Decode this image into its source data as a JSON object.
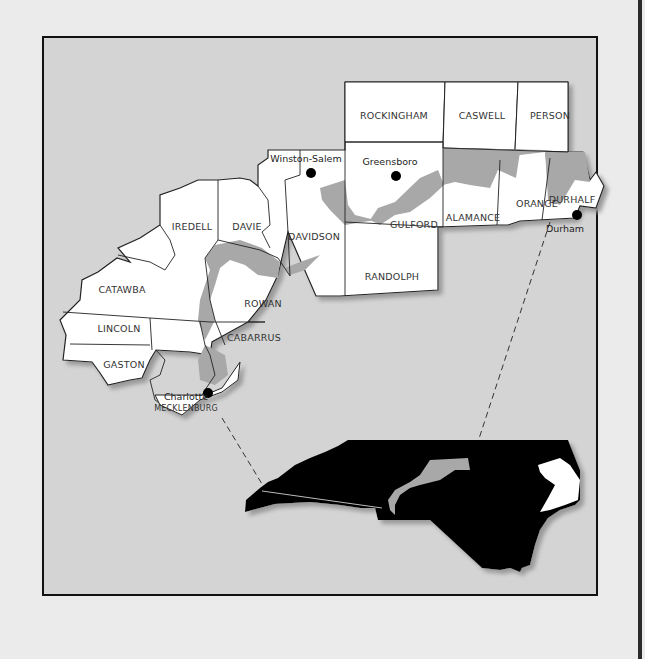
{
  "map": {
    "title": "",
    "colors": {
      "page_background": "#ebebeb",
      "frame_background": "#d4d4d4",
      "county_fill": "#ffffff",
      "urban_shading": "#a8a8a8",
      "state_fill": "#000000",
      "city_dot": "#000000"
    },
    "counties": [
      {
        "name": "ROCKINGHAM"
      },
      {
        "name": "CASWELL"
      },
      {
        "name": "PERSON"
      },
      {
        "name": "GULFORD"
      },
      {
        "name": "ALAMANCE"
      },
      {
        "name": "ORANGE"
      },
      {
        "name": "DURHALF"
      },
      {
        "name": "DAVIDSON"
      },
      {
        "name": "RANDOLPH"
      },
      {
        "name": "IREDELL"
      },
      {
        "name": "DAVIE"
      },
      {
        "name": "ROWAN"
      },
      {
        "name": "CATAWBA"
      },
      {
        "name": "LINCOLN"
      },
      {
        "name": "GASTON"
      },
      {
        "name": "CABARRUS"
      },
      {
        "name": "MECKLENBURG"
      }
    ],
    "cities": [
      {
        "name": "Winston-Salem"
      },
      {
        "name": "Greensboro"
      },
      {
        "name": "Durham"
      },
      {
        "name": "Charlotte"
      }
    ],
    "inset": {
      "label": "North Carolina locator"
    }
  }
}
